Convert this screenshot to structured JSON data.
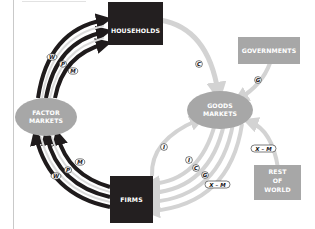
{
  "diagram": {
    "nodes": {
      "households": {
        "label": "HOUSEHOLDS"
      },
      "firms": {
        "label": "FIRMS"
      },
      "factor_markets": {
        "line1": "FACTOR",
        "line2": "MARKETS"
      },
      "goods_markets": {
        "line1": "GOODS",
        "line2": "MARKETS"
      },
      "governments": {
        "label": "GOVERNMENTS"
      },
      "rest_of_world": {
        "line1": "REST",
        "line2": "OF",
        "line3": "WORLD"
      }
    },
    "flow_labels": {
      "factor_to_households": [
        "W",
        "P",
        "M"
      ],
      "firms_to_factor": [
        "W",
        "P",
        "M"
      ],
      "households_to_goods": "C",
      "governments_to_goods": "G",
      "goods_to_firms": [
        "I",
        "C",
        "G",
        "X – M"
      ],
      "firms_to_goods": "I",
      "world_to_goods": "X – M"
    },
    "colors": {
      "dark_box": "#231f20",
      "gray_node": "#a7a7a7",
      "dark_arrow": "#1f1b1c",
      "light_arrow": "#d3d3d3",
      "frame_line": "#c9c9c9"
    }
  }
}
